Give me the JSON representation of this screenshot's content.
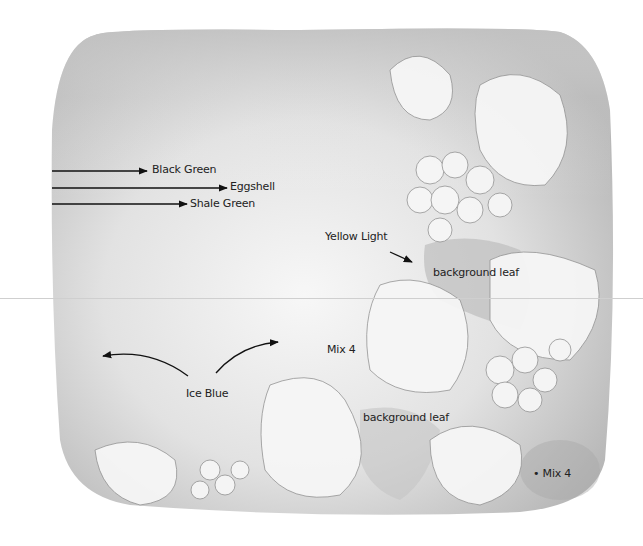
{
  "diagram": {
    "type": "annotated painting guide",
    "background_colors": {
      "paper": "#ffffff",
      "wash_dark": "#b9b9b9",
      "wash_mid": "#d6d6d6",
      "wash_light": "#efefef",
      "outline": "#8a8a8a",
      "arrow": "#111111"
    },
    "labels": [
      {
        "id": "black-green",
        "text": "Black Green",
        "x": 152,
        "y": 163
      },
      {
        "id": "eggshell",
        "text": "Eggshell",
        "x": 230,
        "y": 180
      },
      {
        "id": "shale-green",
        "text": "Shale Green",
        "x": 190,
        "y": 197
      },
      {
        "id": "yellow-light",
        "text": "Yellow Light",
        "x": 325,
        "y": 230
      },
      {
        "id": "background-leaf-1",
        "text": "background leaf",
        "x": 433,
        "y": 266
      },
      {
        "id": "mix-4-center",
        "text": "Mix 4",
        "x": 327,
        "y": 343
      },
      {
        "id": "ice-blue",
        "text": "Ice Blue",
        "x": 186,
        "y": 387
      },
      {
        "id": "background-leaf-2",
        "text": "background leaf",
        "x": 363,
        "y": 411
      },
      {
        "id": "mix-4-corner",
        "text": "• Mix 4",
        "x": 533,
        "y": 467
      }
    ]
  }
}
